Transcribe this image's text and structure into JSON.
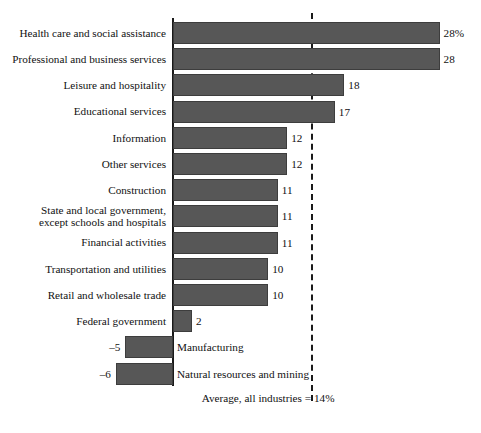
{
  "chart_data": {
    "type": "bar",
    "orientation": "horizontal",
    "title": "",
    "subtitle": "",
    "xlabel": "",
    "ylabel": "",
    "xlim": [
      -8,
      30
    ],
    "grid": false,
    "legend": null,
    "value_suffix": "%",
    "categories": [
      "Health care and social assistance",
      "Professional and business services",
      "Leisure and hospitality",
      "Educational services",
      "Information",
      "Other services",
      "Construction",
      "State and local government,\nexcept schools and hospitals",
      "Financial activities",
      "Transportation and utilities",
      "Retail and wholesale trade",
      "Federal government",
      "Manufacturing",
      "Natural resources and mining"
    ],
    "values": [
      28,
      28,
      18,
      17,
      12,
      12,
      11,
      11,
      11,
      10,
      10,
      2,
      -5,
      -6
    ],
    "value_labels": [
      "28%",
      "28",
      "18",
      "17",
      "12",
      "12",
      "11",
      "11",
      "11",
      "10",
      "10",
      "2",
      "–5",
      "–6"
    ],
    "reference_line": {
      "value": 14,
      "style": "dashed",
      "label_left": "Average, all industries =",
      "label_right": "14%"
    },
    "colors": {
      "bar_fill": "#575757",
      "bar_stroke": "#3d3d3d",
      "axis": "#1a1a1a",
      "text": "#111111",
      "background": "#ffffff"
    }
  },
  "rows": [
    {
      "label_line1": "Health care and social assistance",
      "label_line2": "",
      "value_label": "28%",
      "negative": false
    },
    {
      "label_line1": "Professional and business services",
      "label_line2": "",
      "value_label": "28",
      "negative": false
    },
    {
      "label_line1": "Leisure and hospitality",
      "label_line2": "",
      "value_label": "18",
      "negative": false
    },
    {
      "label_line1": "Educational services",
      "label_line2": "",
      "value_label": "17",
      "negative": false
    },
    {
      "label_line1": "Information",
      "label_line2": "",
      "value_label": "12",
      "negative": false
    },
    {
      "label_line1": "Other services",
      "label_line2": "",
      "value_label": "12",
      "negative": false
    },
    {
      "label_line1": "Construction",
      "label_line2": "",
      "value_label": "11",
      "negative": false
    },
    {
      "label_line1": "State and local government,",
      "label_line2": "except schools and hospitals",
      "value_label": "11",
      "negative": false
    },
    {
      "label_line1": "Financial activities",
      "label_line2": "",
      "value_label": "11",
      "negative": false
    },
    {
      "label_line1": "Transportation and utilities",
      "label_line2": "",
      "value_label": "10",
      "negative": false
    },
    {
      "label_line1": "Retail and wholesale trade",
      "label_line2": "",
      "value_label": "10",
      "negative": false
    },
    {
      "label_line1": "Federal government",
      "label_line2": "",
      "value_label": "2",
      "negative": false
    },
    {
      "label_line1": "Manufacturing",
      "label_line2": "",
      "value_label": "–5",
      "negative": true
    },
    {
      "label_line1": "Natural resources and mining",
      "label_line2": "",
      "value_label": "–6",
      "negative": true
    }
  ],
  "footer": {
    "average_text": "Average, all industries =",
    "average_value": "14%"
  }
}
